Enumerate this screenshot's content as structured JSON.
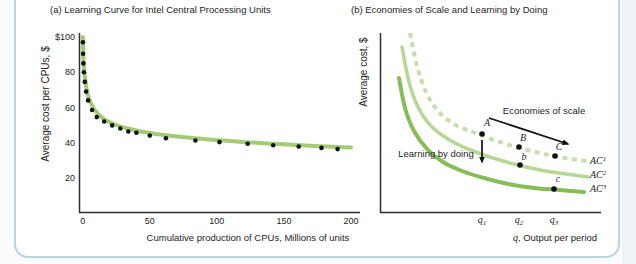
{
  "figure": {
    "frame_border_color": "#b7d4e2",
    "background": "#ffffff",
    "axis_color": "#2f2f2f",
    "dot_color": "#111111"
  },
  "chart_data": [
    {
      "type": "line",
      "title": "(a) Learning Curve for Intel Central Processing Units",
      "xlabel": "Cumulative production of CPUs, Millions of units",
      "ylabel": "Average cost per CPUs, $",
      "xlim": [
        0,
        200
      ],
      "ylim": [
        0,
        110
      ],
      "grid": false,
      "legend": "none",
      "xticks": [
        0,
        50,
        100,
        150,
        200
      ],
      "xtick_labels": [
        "0",
        "50",
        "100",
        "150",
        "200"
      ],
      "ytick_values": [
        100,
        80,
        60,
        40,
        20
      ],
      "ytick_labels": [
        "$100",
        "80",
        "60",
        "40",
        "20"
      ],
      "curve_color": "#a2cb74",
      "curve": [
        [
          0.1,
          100
        ],
        [
          0.3,
          93
        ],
        [
          0.6,
          87
        ],
        [
          1,
          82
        ],
        [
          1.8,
          76.5
        ],
        [
          2.8,
          71
        ],
        [
          4.5,
          65.5
        ],
        [
          7,
          61
        ],
        [
          10,
          57.5
        ],
        [
          14,
          54.5
        ],
        [
          19,
          52
        ],
        [
          25,
          50
        ],
        [
          32,
          48.3
        ],
        [
          40,
          46.9
        ],
        [
          50,
          45.5
        ],
        [
          62,
          44.2
        ],
        [
          76,
          43
        ],
        [
          92,
          41.9
        ],
        [
          110,
          40.9
        ],
        [
          130,
          39.9
        ],
        [
          150,
          39
        ],
        [
          170,
          38.2
        ],
        [
          190,
          37.5
        ],
        [
          200,
          37.2
        ]
      ],
      "points": [
        [
          0.15,
          97
        ],
        [
          0.3,
          90.5
        ],
        [
          0.5,
          85
        ],
        [
          0.9,
          80
        ],
        [
          1.6,
          74.5
        ],
        [
          2.5,
          69
        ],
        [
          4,
          64
        ],
        [
          7,
          58.5
        ],
        [
          10.5,
          54.5
        ],
        [
          16,
          52
        ],
        [
          22,
          49.8
        ],
        [
          28,
          48
        ],
        [
          34,
          46.3
        ],
        [
          40,
          45.6
        ],
        [
          50,
          44
        ],
        [
          62,
          42.5
        ],
        [
          84,
          41.2
        ],
        [
          102,
          40.3
        ],
        [
          123,
          39.3
        ],
        [
          142,
          38.5
        ],
        [
          161,
          37.7
        ],
        [
          178,
          37
        ],
        [
          190,
          36.3
        ]
      ]
    },
    {
      "type": "line",
      "title": "(b) Economies of Scale and Learning by Doing",
      "xlabel": "q, Output per period",
      "xlabel_parts": {
        "var": "q",
        "rest": ", Output per period"
      },
      "ylabel": "Average cost, $",
      "grid": false,
      "xtick_labels": [
        {
          "base": "q",
          "sub": "1"
        },
        {
          "base": "q",
          "sub": "2"
        },
        {
          "base": "q",
          "sub": "3"
        }
      ],
      "xtick_px": [
        482,
        519,
        554
      ],
      "series": [
        {
          "name": {
            "base": "AC",
            "sup": "1"
          },
          "style": "dashed",
          "color": "#c7dfae",
          "width": 4,
          "points_px": [
            [
              410,
              33
            ],
            [
              417,
              66
            ],
            [
              426,
              92
            ],
            [
              438,
              111
            ],
            [
              454,
              124
            ],
            [
              473,
              132
            ],
            [
              494,
              140
            ],
            [
              516,
              147
            ],
            [
              540,
              153
            ],
            [
              565,
              158
            ],
            [
              592,
              162
            ]
          ],
          "label_px": [
            590,
            161
          ]
        },
        {
          "name": {
            "base": "AC",
            "sup": "2"
          },
          "style": "solid",
          "color": "#b7d795",
          "width": 3.6,
          "points_px": [
            [
              402,
              47
            ],
            [
              409,
              82
            ],
            [
              418,
              107
            ],
            [
              431,
              126
            ],
            [
              448,
              139
            ],
            [
              468,
              149
            ],
            [
              490,
              157
            ],
            [
              514,
              164
            ],
            [
              540,
              170
            ],
            [
              566,
              174
            ],
            [
              588,
              177
            ]
          ],
          "label_px": [
            590,
            175
          ]
        },
        {
          "name": {
            "base": "AC",
            "sup": "3"
          },
          "style": "solid",
          "color": "#87bd58",
          "width": 4,
          "points_px": [
            [
              399,
              78
            ],
            [
              405,
              108
            ],
            [
              414,
              131
            ],
            [
              427,
              149
            ],
            [
              443,
              162
            ],
            [
              462,
              171
            ],
            [
              484,
              178
            ],
            [
              508,
              184
            ],
            [
              534,
              188
            ],
            [
              560,
              190
            ],
            [
              584,
              192
            ]
          ],
          "label_px": [
            590,
            189
          ]
        }
      ],
      "points": [
        {
          "label": "A",
          "dot_px": [
            482,
            134
          ],
          "label_px": [
            487,
            123
          ]
        },
        {
          "label": "B",
          "dot_px": [
            519,
            147
          ],
          "label_px": [
            523,
            138
          ]
        },
        {
          "label": "C",
          "dot_px": [
            555,
            156
          ],
          "label_px": [
            559,
            147
          ]
        },
        {
          "label": "b",
          "dot_px": [
            520,
            165
          ],
          "label_px": [
            524,
            157
          ]
        },
        {
          "label": "c",
          "dot_px": [
            554,
            189
          ],
          "label_px": [
            558,
            179
          ]
        }
      ],
      "annotations": [
        {
          "text": "Economies of scale",
          "type": "arrow",
          "from_px": [
            489,
            118
          ],
          "to_px": [
            568,
            144
          ]
        },
        {
          "text": "Learning by doing",
          "type": "arrow",
          "from_px": [
            482,
            140
          ],
          "to_px": [
            482,
            162
          ]
        }
      ]
    }
  ]
}
